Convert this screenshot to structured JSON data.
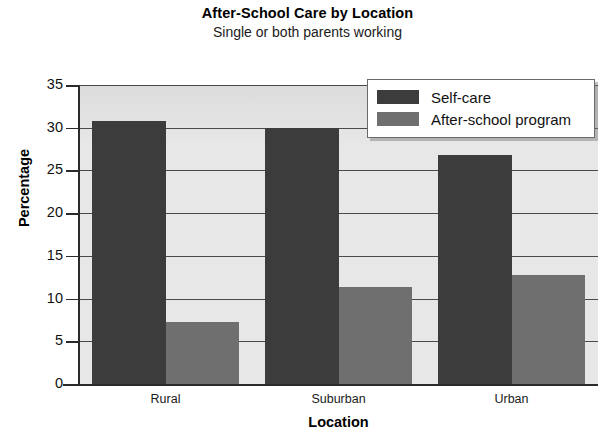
{
  "chart_data": {
    "type": "bar",
    "title": "After-School Care by Location",
    "subtitle": "Single or both parents working",
    "xlabel": "Location",
    "ylabel": "Percentage",
    "categories": [
      "Rural",
      "Suburban",
      "Urban"
    ],
    "series": [
      {
        "name": "Self-care",
        "color": "#3c3c3c",
        "values": [
          30.8,
          30.0,
          26.8
        ]
      },
      {
        "name": "After-school program",
        "color": "#6f6f6f",
        "values": [
          7.3,
          11.3,
          12.8
        ]
      }
    ],
    "ylim": [
      0,
      35
    ],
    "yticks": [
      0,
      5,
      10,
      15,
      20,
      25,
      30,
      35
    ],
    "ytick_labels": [
      "0",
      "5",
      "10",
      "15",
      "20",
      "25",
      "30",
      "35"
    ],
    "grid": "horizontal",
    "legend_position": "top-right",
    "plot_background": "#e7e7e7"
  }
}
